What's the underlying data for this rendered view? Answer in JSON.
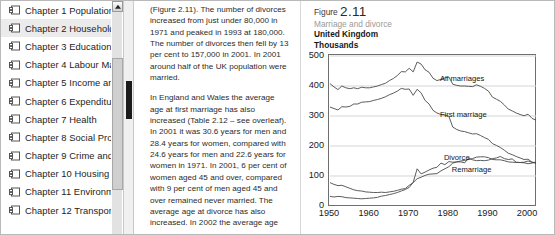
{
  "sidebar": {
    "name": "bookmarks-panel",
    "items": [
      {
        "id": "chapter-1",
        "label": "Chapter 1 Population",
        "icon": "folder-icon",
        "selected": false
      },
      {
        "id": "chapter-2",
        "label": "Chapter 2 Households",
        "icon": "folder-icon",
        "selected": true
      },
      {
        "id": "chapter-3",
        "label": "Chapter 3 Education",
        "icon": "folder-icon",
        "selected": false
      },
      {
        "id": "chapter-4",
        "label": "Chapter 4 Labour Market",
        "icon": "folder-icon",
        "selected": false
      },
      {
        "id": "chapter-5",
        "label": "Chapter 5 Income and Wealth",
        "icon": "folder-icon",
        "selected": false
      },
      {
        "id": "chapter-6",
        "label": "Chapter 6 Expenditure",
        "icon": "folder-icon",
        "selected": false
      },
      {
        "id": "chapter-7",
        "label": "Chapter 7 Health",
        "icon": "folder-icon",
        "selected": false
      },
      {
        "id": "chapter-8",
        "label": "Chapter 8 Social Protection",
        "icon": "folder-icon",
        "selected": false
      },
      {
        "id": "chapter-9",
        "label": "Chapter 9 Crime and Justice",
        "icon": "folder-icon",
        "selected": false
      },
      {
        "id": "chapter-10",
        "label": "Chapter 10 Housing",
        "icon": "folder-icon",
        "selected": false
      },
      {
        "id": "chapter-11",
        "label": "Chapter 11 Environment",
        "icon": "folder-icon",
        "selected": false
      },
      {
        "id": "chapter-12",
        "label": "Chapter 12 Transport",
        "icon": "folder-icon",
        "selected": false
      }
    ]
  },
  "scrollbars": {
    "outer": {
      "name": "outer-scrollbar",
      "up_arrow": "triangle-up-icon"
    },
    "inner": {
      "name": "inner-scrollbar"
    }
  },
  "text_column": {
    "paragraphs": [
      "(Figure 2.11). The number of divorces increased from just under 80,000 in 1971 and peaked in 1993 at 180,000. The number of divorces then fell by 13 per cent to 157,000 in 2001. In 2001 around half of the UK population were married.",
      "In England and Wales the average age at first marriage has also increased (Table 2.12 – see overleaf). In 2001 it was 30.6 years for men and 28.4 years for women, compared with 24.6 years for men and 22.6 years for women in 1971. In 2001, 6 per cent of women aged 45 and over, compared with 9 per cent of men aged 45 and over remained never married. The average age at divorce has also increased. In 2002 the average age was 41.9 years for men and"
    ]
  },
  "figure": {
    "number_prefix": "Figure",
    "number": "2.11",
    "subtitle": "Marriage and divorce",
    "geography": "United Kingdom",
    "units": "Thousands"
  },
  "chart_data": {
    "type": "line",
    "title": "Marriage and divorce",
    "subtitle": "United Kingdom",
    "xlabel": "",
    "ylabel": "Thousands",
    "xlim": [
      1950,
      2002
    ],
    "ylim": [
      0,
      500
    ],
    "xticks": [
      1950,
      1960,
      1970,
      1980,
      1990,
      2000
    ],
    "yticks": [
      0,
      100,
      200,
      300,
      400,
      500
    ],
    "grid": "horizontal",
    "legend_position": "inline-annotations",
    "series": [
      {
        "name": "All marriages",
        "label_x": 1978,
        "label_y": 420,
        "x": [
          1950,
          1951,
          1952,
          1953,
          1954,
          1955,
          1956,
          1957,
          1958,
          1959,
          1960,
          1961,
          1962,
          1963,
          1964,
          1965,
          1966,
          1967,
          1968,
          1969,
          1970,
          1971,
          1972,
          1973,
          1974,
          1975,
          1976,
          1977,
          1978,
          1979,
          1980,
          1981,
          1982,
          1983,
          1984,
          1985,
          1986,
          1987,
          1988,
          1989,
          1990,
          1991,
          1992,
          1993,
          1994,
          1995,
          1996,
          1997,
          1998,
          1999,
          2000,
          2001,
          2002
        ],
        "values": [
          408,
          397,
          388,
          400,
          394,
          391,
          394,
          391,
          396,
          394,
          394,
          397,
          400,
          405,
          409,
          418,
          425,
          435,
          448,
          447,
          459,
          447,
          480,
          473,
          454,
          446,
          426,
          418,
          422,
          427,
          430,
          406,
          402,
          400,
          400,
          399,
          398,
          404,
          399,
          392,
          383,
          363,
          356,
          349,
          337,
          323,
          317,
          310,
          305,
          301,
          306,
          292,
          286
        ]
      },
      {
        "name": "First marriage",
        "label_x": 1978,
        "label_y": 300,
        "x": [
          1950,
          1951,
          1952,
          1953,
          1954,
          1955,
          1956,
          1957,
          1958,
          1959,
          1960,
          1961,
          1962,
          1963,
          1964,
          1965,
          1966,
          1967,
          1968,
          1969,
          1970,
          1971,
          1972,
          1973,
          1974,
          1975,
          1976,
          1977,
          1978,
          1979,
          1980,
          1981,
          1982,
          1983,
          1984,
          1985,
          1986,
          1987,
          1988,
          1989,
          1990,
          1991,
          1992,
          1993,
          1994,
          1995,
          1996,
          1997,
          1998,
          1999,
          2000,
          2001,
          2002
        ],
        "values": [
          330,
          325,
          320,
          331,
          330,
          332,
          340,
          340,
          346,
          347,
          348,
          352,
          355,
          359,
          364,
          371,
          376,
          383,
          392,
          389,
          390,
          369,
          389,
          377,
          352,
          340,
          319,
          310,
          305,
          303,
          299,
          263,
          255,
          250,
          248,
          244,
          240,
          241,
          235,
          228,
          222,
          208,
          202,
          195,
          186,
          176,
          171,
          165,
          160,
          155,
          156,
          146,
          142
        ]
      },
      {
        "name": "Divorce",
        "label_x": 1979,
        "label_y": 158,
        "x": [
          1950,
          1951,
          1952,
          1953,
          1954,
          1955,
          1956,
          1957,
          1958,
          1959,
          1960,
          1961,
          1962,
          1963,
          1964,
          1965,
          1966,
          1967,
          1968,
          1969,
          1970,
          1971,
          1972,
          1973,
          1974,
          1975,
          1976,
          1977,
          1978,
          1979,
          1980,
          1981,
          1982,
          1983,
          1984,
          1985,
          1986,
          1987,
          1988,
          1989,
          1990,
          1991,
          1992,
          1993,
          1994,
          1995,
          1996,
          1997,
          1998,
          1999,
          2000,
          2001,
          2002
        ],
        "values": [
          32,
          30,
          32,
          31,
          28,
          27,
          26,
          25,
          24,
          25,
          26,
          27,
          29,
          33,
          35,
          38,
          41,
          45,
          50,
          55,
          62,
          79,
          124,
          107,
          113,
          120,
          126,
          129,
          143,
          138,
          148,
          146,
          147,
          147,
          144,
          160,
          154,
          151,
          152,
          151,
          153,
          158,
          160,
          165,
          158,
          155,
          157,
          146,
          145,
          144,
          141,
          143,
          147
        ]
      },
      {
        "name": "Remarriage",
        "label_x": 1981,
        "label_y": 118,
        "x": [
          1950,
          1951,
          1952,
          1953,
          1954,
          1955,
          1956,
          1957,
          1958,
          1959,
          1960,
          1961,
          1962,
          1963,
          1964,
          1965,
          1966,
          1967,
          1968,
          1969,
          1970,
          1971,
          1972,
          1973,
          1974,
          1975,
          1976,
          1977,
          1978,
          1979,
          1980,
          1981,
          1982,
          1983,
          1984,
          1985,
          1986,
          1987,
          1988,
          1989,
          1990,
          1991,
          1992,
          1993,
          1994,
          1995,
          1996,
          1997,
          1998,
          1999,
          2000,
          2001,
          2002
        ],
        "values": [
          78,
          72,
          68,
          69,
          64,
          59,
          54,
          51,
          50,
          47,
          46,
          45,
          45,
          46,
          45,
          47,
          49,
          52,
          56,
          58,
          69,
          78,
          91,
          96,
          102,
          106,
          107,
          108,
          117,
          124,
          131,
          143,
          147,
          150,
          152,
          155,
          158,
          163,
          164,
          164,
          161,
          155,
          154,
          154,
          151,
          147,
          146,
          145,
          145,
          146,
          150,
          146,
          144
        ]
      }
    ]
  }
}
